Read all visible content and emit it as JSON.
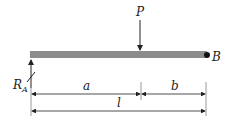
{
  "diagram": {
    "type": "simply-supported beam with point load",
    "labels": {
      "load": "P",
      "reaction_left": "R",
      "reaction_left_sub": "A",
      "support_right": "B",
      "segment_a": "a",
      "segment_b": "b",
      "total_length": "l"
    },
    "colors": {
      "beam": "#8c8c8c",
      "lines": "#222222"
    }
  }
}
